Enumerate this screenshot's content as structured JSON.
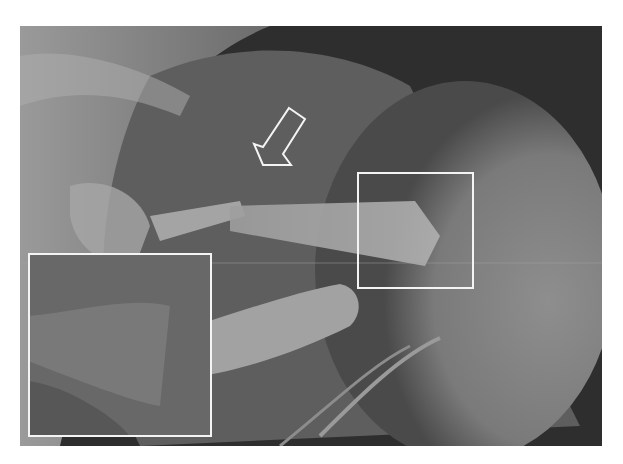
{
  "figure": {
    "type": "radiograph",
    "annotations": {
      "arrow": {
        "shape": "outlined-arrow",
        "direction": "down-left",
        "color": "#ffffff"
      },
      "roi_box": {
        "shape": "rectangle-outline",
        "color": "#ffffff",
        "x": 357,
        "y": 172,
        "width": 117,
        "height": 117
      },
      "magnified_inset": {
        "shape": "rectangle-outline",
        "color": "#ffffff",
        "x": 28,
        "y": 253,
        "width": 184,
        "height": 184
      }
    },
    "colors": {
      "background": "#ffffff",
      "dark_region": "#2a2a2a",
      "soft_tissue": "#7a7a7a",
      "bone": "#a8a8a8",
      "annotation": "#f4f4f4"
    }
  }
}
